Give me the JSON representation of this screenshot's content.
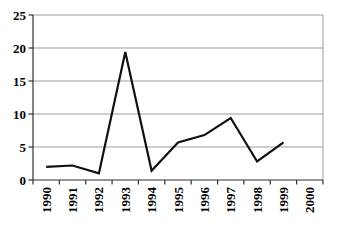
{
  "chart_data": {
    "type": "line",
    "title": "",
    "xlabel": "",
    "ylabel": "",
    "categories": [
      "1990",
      "1991",
      "1992",
      "1993",
      "1994",
      "1995",
      "1996",
      "1997",
      "1998",
      "1999",
      "2000"
    ],
    "series": [
      {
        "name": "series-1",
        "values": [
          2,
          2.2,
          1,
          19.4,
          1.4,
          5.7,
          6.8,
          9.4,
          2.8,
          5.7,
          null
        ]
      }
    ],
    "ylim": [
      0,
      25
    ],
    "yticks": [
      0,
      5,
      10,
      15,
      20,
      25
    ],
    "grid": "horizontal-solid",
    "legend": "none",
    "x_label_rotation_deg": -90,
    "colors": {
      "line": "#101010",
      "gridline": "#9c9c9c",
      "plot_border": "#9c9c9c",
      "axis": "#2f2f2f",
      "tick": "#2f2f2f",
      "label": "#000000",
      "background": "#ffffff"
    }
  }
}
